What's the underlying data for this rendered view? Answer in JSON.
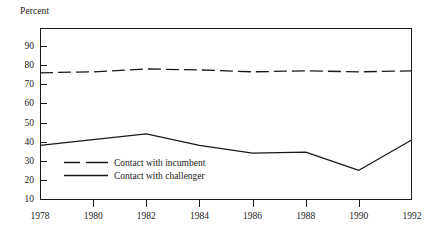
{
  "chart_data": {
    "type": "line",
    "title": "",
    "subtitle": "",
    "xlabel": "",
    "ylabel": "Percent",
    "x": [
      1978,
      1980,
      1982,
      1984,
      1986,
      1988,
      1990,
      1992
    ],
    "xticklabels": [
      "1978",
      "1980",
      "1982",
      "1984",
      "1986",
      "1988",
      "1990",
      "1992"
    ],
    "xlim": [
      1978,
      1992
    ],
    "ylim": [
      0,
      95
    ],
    "yticks": [
      10,
      20,
      30,
      40,
      50,
      60,
      70,
      80,
      90
    ],
    "yticklabels": [
      "90",
      "80",
      "70",
      "60",
      "50",
      "40",
      "30",
      "20",
      "10"
    ],
    "grid": false,
    "legend_position": "inside-lower-left",
    "series": [
      {
        "name": "Contact with incumbent",
        "style": "dashed",
        "color": "#1a1a1a",
        "values": [
          76,
          76.5,
          78,
          77.5,
          76.5,
          77,
          76.5,
          77
        ]
      },
      {
        "name": "Contact with challenger",
        "style": "solid",
        "color": "#1a1a1a",
        "values": [
          38,
          41,
          44,
          38,
          34,
          34.5,
          25,
          41
        ]
      }
    ]
  },
  "legend": {
    "items": [
      {
        "label": "Contact with incumbent",
        "style": "dashed"
      },
      {
        "label": "Contact with challenger",
        "style": "solid"
      }
    ]
  },
  "axis": {
    "y_caption": "Percent"
  }
}
